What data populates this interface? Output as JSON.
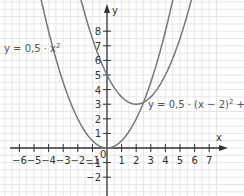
{
  "chart_data": {
    "type": "line",
    "title": "",
    "xlabel": "x",
    "ylabel": "y",
    "xlim": [
      -6.5,
      7.5
    ],
    "ylim": [
      -2.5,
      9
    ],
    "grid": true,
    "x_ticks": [
      "−6",
      "−5",
      "−4",
      "−3",
      "−2",
      "−1",
      "1",
      "2",
      "3",
      "4",
      "5",
      "6",
      "7"
    ],
    "y_ticks": [
      "8",
      "7",
      "6",
      "5",
      "4",
      "3",
      "2",
      "1",
      "−1",
      "−2"
    ],
    "origin_label": "0",
    "series": [
      {
        "name": "y = 0,5 · x²",
        "formula": "0.5*x^2",
        "x": [
          -4,
          -3,
          -2,
          -1,
          0,
          1,
          2,
          3,
          4
        ],
        "values": [
          8,
          4.5,
          2,
          0.5,
          0,
          0.5,
          2,
          4.5,
          8
        ]
      },
      {
        "name": "y = 0,5 · (x − 2)² + 3",
        "formula": "0.5*(x-2)^2+3",
        "x": [
          -1,
          0,
          1,
          2,
          3,
          4,
          5
        ],
        "values": [
          7.5,
          5,
          3.5,
          3,
          3.5,
          5,
          7.5
        ]
      }
    ],
    "annotations": [
      {
        "text": "y = 0,5 · x²",
        "position": "left"
      },
      {
        "text": "y = 0,5 · (x − 2)² + 3",
        "position": "right of vertex"
      }
    ],
    "colors": {
      "curve": "#777777",
      "axis": "#333333",
      "grid": "#e6e6e6"
    }
  },
  "labels": {
    "x_axis": "x",
    "y_axis": "y",
    "curve1_a": "y = 0,5 · x",
    "curve1_sup": "2",
    "curve2_a": "y = 0,5 · (x − 2)",
    "curve2_sup": "2",
    "curve2_b": " + 3",
    "origin": "0"
  }
}
